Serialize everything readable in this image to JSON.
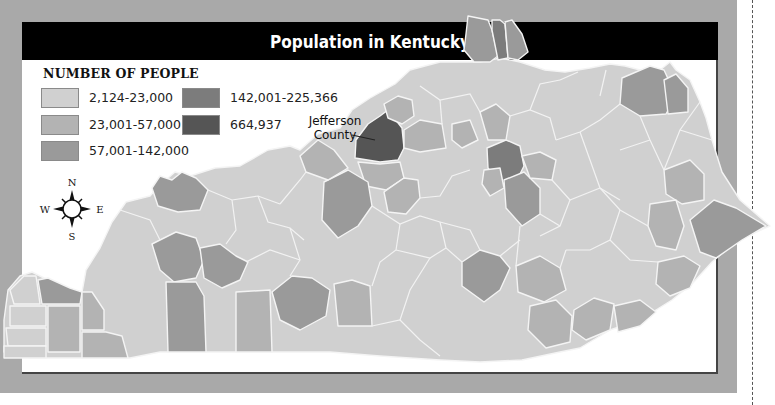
{
  "title": "Population in Kentucky",
  "legend": {
    "title": "NUMBER OF PEOPLE",
    "items": [
      {
        "label": "2,124-23,000",
        "color": "#d0d0d0"
      },
      {
        "label": "23,001-57,000",
        "color": "#b3b3b3"
      },
      {
        "label": "57,001-142,000",
        "color": "#9a9a9a"
      },
      {
        "label": "142,001-225,366",
        "color": "#7c7c7c"
      },
      {
        "label": "664,937",
        "color": "#555555"
      }
    ]
  },
  "callout": {
    "line1": "Jefferson",
    "line2": "County"
  },
  "compass": {
    "n": "N",
    "s": "S",
    "e": "E",
    "w": "W"
  },
  "colors": {
    "frame": "#a9a9a9",
    "title_bar": "#000000",
    "panel": "#ffffff",
    "border_lines": "#f2f2f2"
  }
}
